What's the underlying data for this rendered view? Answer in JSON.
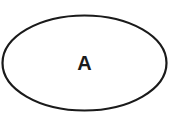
{
  "diagram": {
    "nodes": [
      {
        "id": "A",
        "label": "A",
        "shape": "ellipse"
      }
    ],
    "colors": {
      "stroke": "#1a1a1a",
      "fill": "#ffffff",
      "text": "#1a1a1a"
    }
  }
}
